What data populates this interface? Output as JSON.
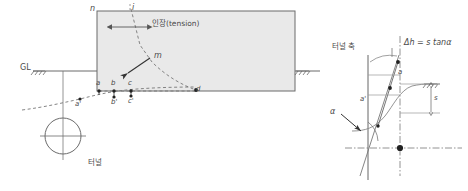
{
  "figure": {
    "title_present": false,
    "background": "#ffffff",
    "ink": "#555555",
    "fill": "#e8e8e8"
  },
  "left_diagram": {
    "name": "tunnel-settlement-trough-section",
    "ground_line_label": "GL",
    "tunnel_label": "터널",
    "tension_label": "인장(tension)",
    "corner_labels": {
      "top_left": "n",
      "top_center": "i",
      "mid_right": "m"
    },
    "surface_points": [
      "a",
      "b",
      "c",
      "d"
    ],
    "displaced_points": [
      "a'",
      "b'",
      "c'"
    ],
    "block": {
      "x": 97,
      "y": 11,
      "w": 198,
      "h": 80
    }
  },
  "right_diagram": {
    "name": "settlement-curve-slope-detail",
    "axis_label": "터널 축",
    "formula": "Δh = s tanα",
    "angle_label": "α",
    "point_labels": [
      "a",
      "a'"
    ],
    "offset_label": "s",
    "origin_dot": true
  }
}
